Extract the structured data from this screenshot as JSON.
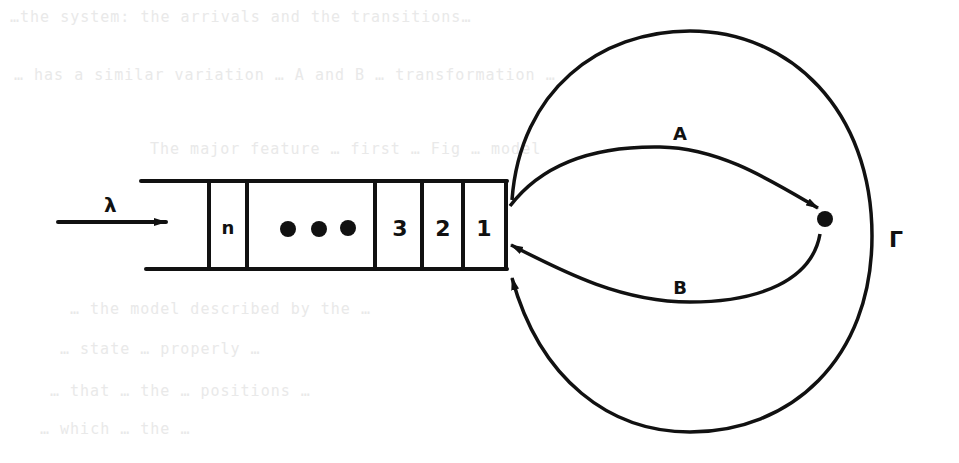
{
  "figure": {
    "type": "queueing-system-diagram",
    "arrival_rate_label": "λ",
    "queue_cells": [
      "n",
      "•••",
      "3",
      "2",
      "1"
    ],
    "server_label": "Γ",
    "paths": [
      {
        "label": "A",
        "direction": "from queue head to server"
      },
      {
        "label": "B",
        "direction": "from server back to queue head"
      }
    ],
    "outer_loop": "closed circle returning to queue head"
  },
  "background_text": {
    "lines": [
      "…the system: the arrivals and the transitions…",
      "… has a similar variation …  A and B … transformation …",
      "The major feature … first … Fig … model",
      "… the model described by the … ",
      "… state … properly …",
      "… that … the … positions …",
      "… which … the …"
    ]
  },
  "colors": {
    "ink": "#111111",
    "paper": "#ffffff",
    "bleed": "#e9e9e9"
  }
}
